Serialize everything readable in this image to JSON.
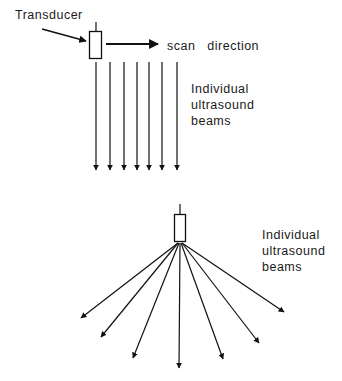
{
  "top": {
    "transducer_label": "Transducer",
    "scan_label": "scan   direction",
    "beams_label": [
      "Individual",
      "ultrasound",
      "beams"
    ],
    "beam_count": 7
  },
  "bottom": {
    "beams_label": [
      "Individual",
      "ultrasound",
      "beams"
    ],
    "beam_count": 7
  },
  "colors": {
    "line": "#111111",
    "text": "#1a1a1a",
    "background": "#ffffff"
  }
}
